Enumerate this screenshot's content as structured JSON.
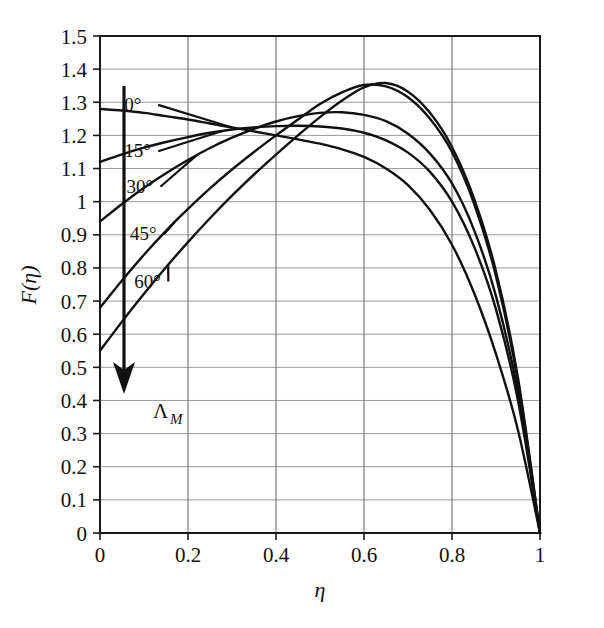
{
  "chart_data": {
    "type": "line",
    "title": "",
    "xlabel": "η",
    "ylabel": "F(η)",
    "xlim": [
      0,
      1
    ],
    "ylim": [
      0,
      1.5
    ],
    "grid": true,
    "legend_position": "inline-curve-labels",
    "x_ticks": [
      "0",
      "0.2",
      "0.4",
      "0.6",
      "0.8",
      "1"
    ],
    "x_tick_values": [
      0,
      0.2,
      0.4,
      0.6,
      0.8,
      1
    ],
    "y_ticks": [
      "0",
      "0.1",
      "0.2",
      "0.3",
      "0.4",
      "0.5",
      "0.6",
      "0.7",
      "0.8",
      "0.9",
      "1",
      "1.1",
      "1.2",
      "1.3",
      "1.4",
      "1.5"
    ],
    "y_tick_values": [
      0,
      0.1,
      0.2,
      0.3,
      0.4,
      0.5,
      0.6,
      0.7,
      0.8,
      0.9,
      1.0,
      1.1,
      1.2,
      1.3,
      1.4,
      1.5
    ],
    "annotation": {
      "arrow_label": "Λ",
      "arrow_label_sub": "M",
      "arrow_direction": "down"
    },
    "x": [
      0,
      0.05,
      0.1,
      0.15,
      0.2,
      0.25,
      0.3,
      0.35,
      0.4,
      0.45,
      0.5,
      0.55,
      0.6,
      0.65,
      0.7,
      0.75,
      0.8,
      0.85,
      0.9,
      0.95,
      1
    ],
    "series": [
      {
        "name": "0°",
        "label": "0°",
        "color": "#111111",
        "values": [
          1.28,
          1.275,
          1.268,
          1.258,
          1.248,
          1.236,
          1.224,
          1.212,
          1.2,
          1.188,
          1.175,
          1.158,
          1.135,
          1.1,
          1.05,
          0.975,
          0.87,
          0.725,
          0.54,
          0.31,
          0.0
        ]
      },
      {
        "name": "15°",
        "label": "15°",
        "color": "#111111",
        "values": [
          1.12,
          1.143,
          1.163,
          1.18,
          1.195,
          1.208,
          1.218,
          1.224,
          1.228,
          1.229,
          1.227,
          1.221,
          1.208,
          1.185,
          1.148,
          1.09,
          1.0,
          0.865,
          0.675,
          0.4,
          0.0
        ]
      },
      {
        "name": "30°",
        "label": "30°",
        "color": "#111111",
        "values": [
          0.94,
          0.993,
          1.042,
          1.086,
          1.126,
          1.162,
          1.193,
          1.22,
          1.242,
          1.258,
          1.268,
          1.27,
          1.262,
          1.243,
          1.205,
          1.145,
          1.055,
          0.915,
          0.715,
          0.425,
          0.0
        ]
      },
      {
        "name": "45°",
        "label": "45°",
        "color": "#111111",
        "values": [
          0.68,
          0.762,
          0.84,
          0.912,
          0.978,
          1.04,
          1.097,
          1.15,
          1.2,
          1.248,
          1.295,
          1.33,
          1.352,
          1.348,
          1.315,
          1.25,
          1.15,
          0.995,
          0.775,
          0.455,
          0.0
        ]
      },
      {
        "name": "60°",
        "label": "60°",
        "color": "#111111",
        "values": [
          0.55,
          0.638,
          0.722,
          0.802,
          0.878,
          0.95,
          1.018,
          1.082,
          1.142,
          1.2,
          1.255,
          1.305,
          1.345,
          1.358,
          1.332,
          1.268,
          1.165,
          1.01,
          0.79,
          0.468,
          0.0
        ]
      }
    ],
    "curve_labels": [
      {
        "text": "0°",
        "x": 0.055,
        "y": 1.295
      },
      {
        "text": "15°",
        "x": 0.055,
        "y": 1.155
      },
      {
        "text": "30°",
        "x": 0.06,
        "y": 1.048
      },
      {
        "text": "45°",
        "x": 0.068,
        "y": 0.905
      },
      {
        "text": "60°",
        "x": 0.078,
        "y": 0.762
      }
    ]
  }
}
